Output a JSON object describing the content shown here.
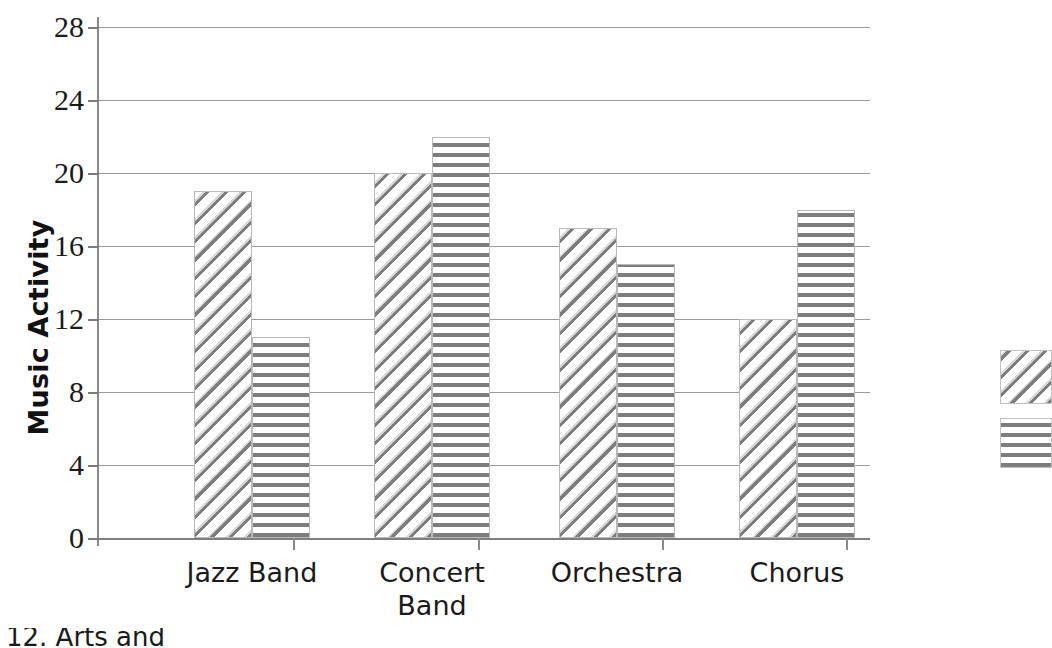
{
  "chart_data": {
    "type": "bar",
    "title": "",
    "xlabel": "",
    "ylabel": "Music Activity",
    "categories": [
      "Jazz Band",
      "Concert Band",
      "Orchestra",
      "Chorus"
    ],
    "category_lines": [
      [
        "Jazz Band"
      ],
      [
        "Concert",
        "Band"
      ],
      [
        "Orchestra"
      ],
      [
        "Chorus"
      ]
    ],
    "series": [
      {
        "name": "series-1",
        "pattern": "diagonal-hatch",
        "values": [
          19,
          20,
          17,
          12
        ]
      },
      {
        "name": "series-2",
        "pattern": "grid-checker",
        "values": [
          11,
          22,
          15,
          18
        ]
      }
    ],
    "ylim": [
      0,
      28
    ],
    "ytick_values": [
      28,
      24,
      20,
      16,
      12,
      8,
      4,
      0
    ],
    "ytick_labels": [
      "28",
      "24",
      "20",
      "16",
      "12",
      "8",
      "4",
      "0"
    ],
    "grid": true,
    "legend_position": "right",
    "colors": {
      "pattern_gray": "#7d7d7d",
      "gridline": "#9a9a9a",
      "axis": "#8a8a8a",
      "background": "#ffffff",
      "text": "#1a1a1a"
    }
  },
  "axis": {
    "y_title": "Music Activity"
  },
  "caption": {
    "text": "12. Arts and"
  }
}
